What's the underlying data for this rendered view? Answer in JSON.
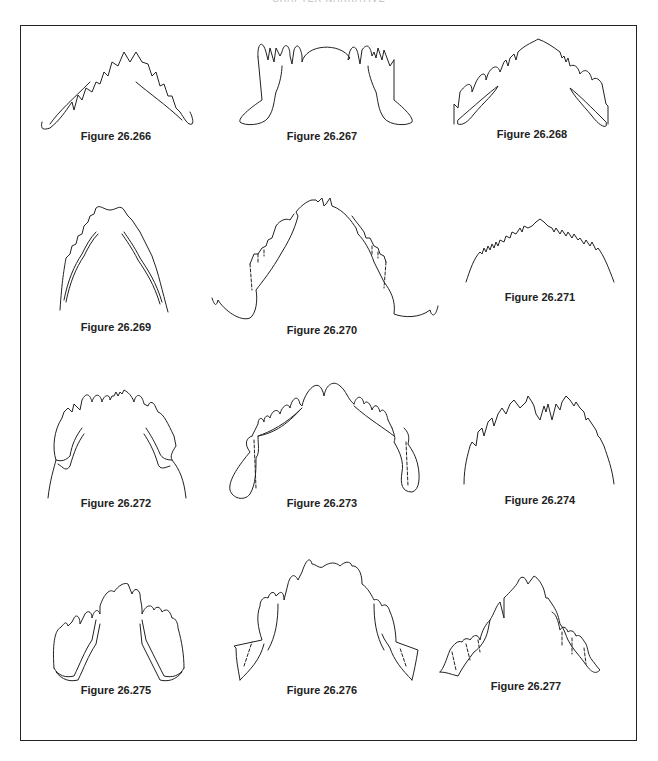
{
  "page": {
    "running_head": "CHAPTER NARRATIVE",
    "frame_color": "#222222",
    "background": "#ffffff"
  },
  "figures": [
    {
      "id": "266",
      "caption": "Figure 26.266",
      "row": 1,
      "col": 1
    },
    {
      "id": "267",
      "caption": "Figure 26.267",
      "row": 1,
      "col": 2
    },
    {
      "id": "268",
      "caption": "Figure 26.268",
      "row": 1,
      "col": 3
    },
    {
      "id": "269",
      "caption": "Figure 26.269",
      "row": 2,
      "col": 1
    },
    {
      "id": "270",
      "caption": "Figure 26.270",
      "row": 2,
      "col": 2
    },
    {
      "id": "271",
      "caption": "Figure 26.271",
      "row": 2,
      "col": 3
    },
    {
      "id": "272",
      "caption": "Figure 26.272",
      "row": 3,
      "col": 1
    },
    {
      "id": "273",
      "caption": "Figure 26.273",
      "row": 3,
      "col": 2
    },
    {
      "id": "274",
      "caption": "Figure 26.274",
      "row": 3,
      "col": 3
    },
    {
      "id": "275",
      "caption": "Figure 26.275",
      "row": 4,
      "col": 1
    },
    {
      "id": "276",
      "caption": "Figure 26.276",
      "row": 4,
      "col": 2
    },
    {
      "id": "277",
      "caption": "Figure 26.277",
      "row": 4,
      "col": 3
    }
  ]
}
